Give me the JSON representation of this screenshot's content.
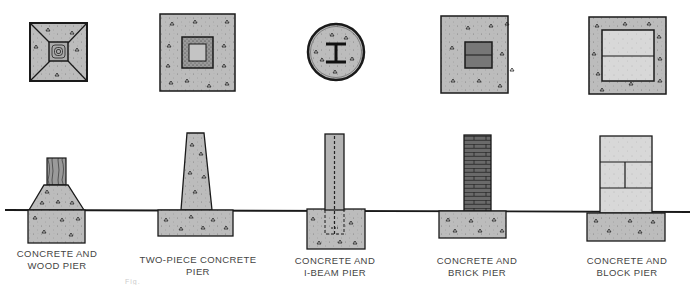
{
  "figure": {
    "type": "diagram",
    "colors": {
      "concrete": "#b8b8b8",
      "concrete_light": "#d6d6d6",
      "brick": "#6e6e6e",
      "outline": "#1a1a1a",
      "ground_line": "#1a1a1a",
      "label_text": "#444444"
    },
    "piers": [
      {
        "id": "concrete-wood",
        "line1": "CONCRETE AND",
        "line2": "WOOD PIER",
        "x": 57
      },
      {
        "id": "two-piece-concrete",
        "line1": "TWO-PIECE CONCRETE",
        "line2": "PIER",
        "x": 198
      },
      {
        "id": "concrete-ibeam",
        "line1": "CONCRETE AND",
        "line2": "I-BEAM PIER",
        "x": 333
      },
      {
        "id": "concrete-brick",
        "line1": "CONCRETE AND",
        "line2": "BRICK PIER",
        "x": 463
      },
      {
        "id": "concrete-block",
        "line1": "CONCRETE AND",
        "line2": "BLOCK PIER",
        "x": 613
      }
    ],
    "caption_ghost": "Fig."
  }
}
